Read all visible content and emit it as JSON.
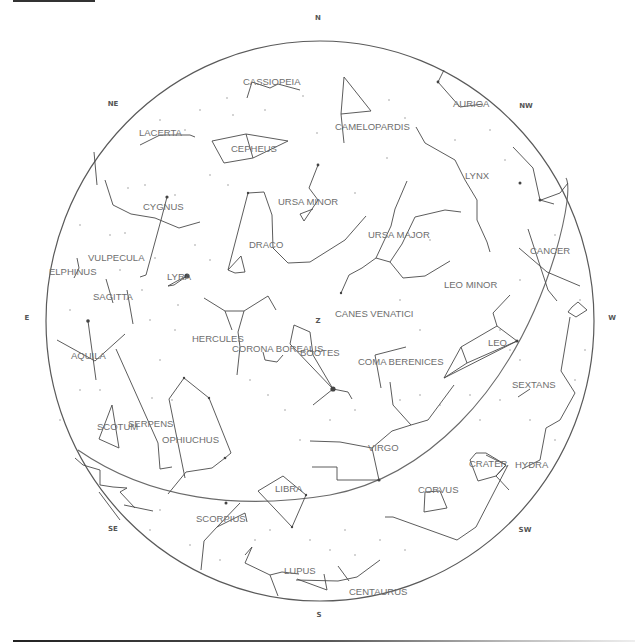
{
  "chart_view": {
    "directions": [
      {
        "label": "N",
        "x": 318,
        "y": 20
      },
      {
        "label": "NE",
        "x": 113,
        "y": 106
      },
      {
        "label": "NW",
        "x": 526,
        "y": 108
      },
      {
        "label": "E",
        "x": 27,
        "y": 318
      },
      {
        "label": "W",
        "x": 612,
        "y": 318
      },
      {
        "label": "SE",
        "x": 113,
        "y": 529
      },
      {
        "label": "SW",
        "x": 525,
        "y": 530
      },
      {
        "label": "S",
        "x": 319,
        "y": 615
      },
      {
        "label": "Z",
        "x": 318,
        "y": 321
      }
    ],
    "constellations": [
      {
        "name": "CASSIOPEIA",
        "x": 243,
        "y": 84
      },
      {
        "name": "AURIGA",
        "x": 453,
        "y": 106
      },
      {
        "name": "CAMELOPARDIS",
        "x": 335,
        "y": 129
      },
      {
        "name": "LACERTA",
        "x": 139,
        "y": 135
      },
      {
        "name": "CEPHEUS",
        "x": 231,
        "y": 151
      },
      {
        "name": "LYNX",
        "x": 465,
        "y": 178
      },
      {
        "name": "CYGNUS",
        "x": 143,
        "y": 209
      },
      {
        "name": "URSA MINOR",
        "x": 278,
        "y": 204
      },
      {
        "name": "URSA MAJOR",
        "x": 368,
        "y": 237
      },
      {
        "name": "DRACO",
        "x": 249,
        "y": 247
      },
      {
        "name": "CANCER",
        "x": 530,
        "y": 253
      },
      {
        "name": "VULPECULA",
        "x": 88,
        "y": 260
      },
      {
        "name": "ELPHINUS",
        "x": 49,
        "y": 274
      },
      {
        "name": "LYRA",
        "x": 167,
        "y": 279
      },
      {
        "name": "LEO MINOR",
        "x": 444,
        "y": 287
      },
      {
        "name": "SAGITTA",
        "x": 93,
        "y": 299
      },
      {
        "name": "CANES VENATICI",
        "x": 335,
        "y": 316
      },
      {
        "name": "HERCULES",
        "x": 192,
        "y": 341
      },
      {
        "name": "LEO",
        "x": 488,
        "y": 345
      },
      {
        "name": "CORONA BOREALIS",
        "x": 232,
        "y": 351
      },
      {
        "name": "BOOTES",
        "x": 300,
        "y": 355
      },
      {
        "name": "AQUILA",
        "x": 71,
        "y": 358
      },
      {
        "name": "COMA BERENICES",
        "x": 358,
        "y": 364
      },
      {
        "name": "SEXTANS",
        "x": 512,
        "y": 387
      },
      {
        "name": "SCOTUM",
        "x": 97,
        "y": 429
      },
      {
        "name": "SERPENS",
        "x": 128,
        "y": 426
      },
      {
        "name": "OPHIUCHUS",
        "x": 162,
        "y": 442
      },
      {
        "name": "VIRGO",
        "x": 368,
        "y": 450
      },
      {
        "name": "CRATER",
        "x": 469,
        "y": 466
      },
      {
        "name": "HYDRA",
        "x": 515,
        "y": 467
      },
      {
        "name": "LIBRA",
        "x": 275,
        "y": 491
      },
      {
        "name": "CORVUS",
        "x": 418,
        "y": 492
      },
      {
        "name": "SCORPIUS",
        "x": 196,
        "y": 521
      },
      {
        "name": "LUPUS",
        "x": 284,
        "y": 573
      },
      {
        "name": "CENTAURUS",
        "x": 349,
        "y": 594
      }
    ],
    "colors": {
      "background": "#ffffff",
      "lines": "#4a4a4a",
      "labels": "#6e6e6e",
      "direction_labels": "#555555"
    }
  }
}
